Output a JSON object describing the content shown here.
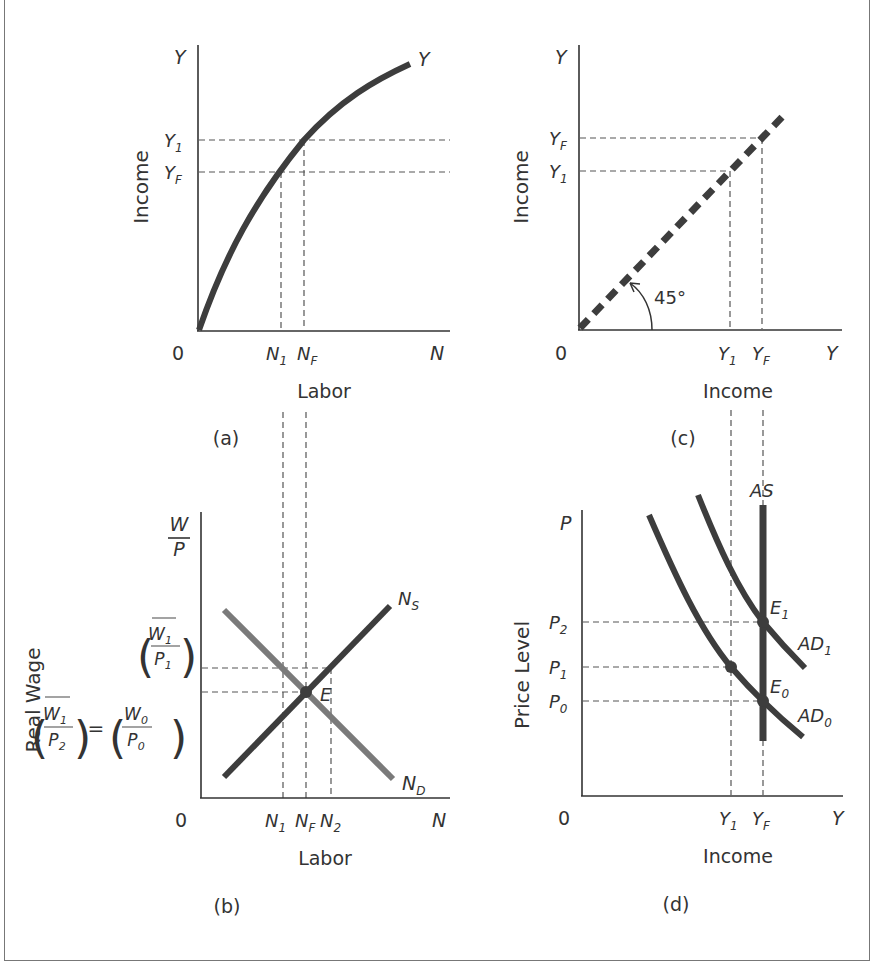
{
  "figure": {
    "panels": [
      {
        "id": "a",
        "caption": "(a)",
        "y_axis_symbol": "Y",
        "y_axis_title": "Income",
        "x_axis_symbol": "N",
        "x_axis_title": "Labor",
        "origin": "0",
        "curve_label": "Y",
        "y_ticks": [
          {
            "base": "Y",
            "sub": "1"
          },
          {
            "base": "Y",
            "sub": "F"
          }
        ],
        "x_ticks": [
          {
            "base": "N",
            "sub": "1"
          },
          {
            "base": "N",
            "sub": "F"
          }
        ]
      },
      {
        "id": "c",
        "caption": "(c)",
        "y_axis_symbol": "Y",
        "y_axis_title": "Income",
        "x_axis_symbol": "Y",
        "x_axis_title": "Income",
        "origin": "0",
        "angle_label": "45°",
        "y_ticks": [
          {
            "base": "Y",
            "sub": "F"
          },
          {
            "base": "Y",
            "sub": "1"
          }
        ],
        "x_ticks": [
          {
            "base": "Y",
            "sub": "1"
          },
          {
            "base": "Y",
            "sub": "F"
          }
        ]
      },
      {
        "id": "b",
        "caption": "(b)",
        "y_axis_symbol_num": "W",
        "y_axis_symbol_den": "P",
        "y_axis_title": "Real Wage",
        "x_axis_symbol": "N",
        "x_axis_title": "Labor",
        "origin": "0",
        "supply_label": {
          "base": "N",
          "sub": "S"
        },
        "demand_label": {
          "base": "N",
          "sub": "D"
        },
        "equilibrium_label": "E",
        "y_tick_upper": {
          "num": "W",
          "num_sub": "1",
          "den": "P",
          "den_sub": "1"
        },
        "y_tick_lower": {
          "lhs_num": "W",
          "lhs_num_sub": "1",
          "lhs_den": "P",
          "lhs_den_sub": "2",
          "equals": "=",
          "rhs_num": "W",
          "rhs_num_sub": "0",
          "rhs_den": "P",
          "rhs_den_sub": "0"
        },
        "x_ticks": [
          {
            "base": "N",
            "sub": "1"
          },
          {
            "base": "N",
            "sub": "F"
          },
          {
            "base": "N",
            "sub": "2"
          }
        ]
      },
      {
        "id": "d",
        "caption": "(d)",
        "y_axis_symbol": "P",
        "y_axis_title": "Price Level",
        "x_axis_symbol": "Y",
        "x_axis_title": "Income",
        "origin": "0",
        "as_label": "AS",
        "ad1_label": {
          "base": "AD",
          "sub": "1"
        },
        "ad0_label": {
          "base": "AD",
          "sub": "0"
        },
        "e1_label": {
          "base": "E",
          "sub": "1"
        },
        "e0_label": {
          "base": "E",
          "sub": "0"
        },
        "y_ticks": [
          {
            "base": "P",
            "sub": "2"
          },
          {
            "base": "P",
            "sub": "1"
          },
          {
            "base": "P",
            "sub": "0"
          }
        ],
        "x_ticks": [
          {
            "base": "Y",
            "sub": "1"
          },
          {
            "base": "Y",
            "sub": "F"
          }
        ]
      }
    ],
    "colors": {
      "axis": "#333333",
      "curve_dark": "#3d3d3d",
      "curve_light": "#7a7a7a",
      "dash": "#555555",
      "text": "#333333"
    }
  }
}
